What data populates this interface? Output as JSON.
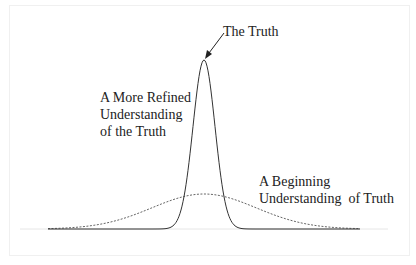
{
  "diagram": {
    "labels": {
      "truth": "The Truth",
      "refined": [
        "A More Refined",
        "Understanding",
        "of the Truth"
      ],
      "beginning": [
        "A Beginning",
        "Understanding  of Truth"
      ]
    },
    "curves": [
      {
        "name": "A More Refined Understanding of the Truth",
        "style": "solid",
        "shape": "narrow-gaussian",
        "peak_x": 204,
        "peak_y": 60
      },
      {
        "name": "A Beginning Understanding of Truth",
        "style": "dotted",
        "shape": "wide-gaussian",
        "peak_x": 204,
        "peak_y": 194
      }
    ],
    "baseline_y": 229,
    "colors": {
      "line": "#333333",
      "dotted": "#666666",
      "frame": "#f0f0f0",
      "background": "#ffffff"
    }
  }
}
